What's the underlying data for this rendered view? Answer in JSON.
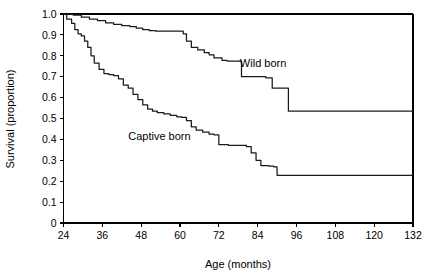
{
  "chart_data": {
    "type": "line",
    "subtype": "kaplan-meier-step",
    "title": "",
    "xlabel": "Age (months)",
    "ylabel": "Survival (proportion)",
    "xlim": [
      24,
      132
    ],
    "ylim": [
      0,
      1.0
    ],
    "xticks": [
      24,
      36,
      48,
      60,
      72,
      84,
      96,
      108,
      120,
      132
    ],
    "xtick_labels": [
      "24",
      "36",
      "48",
      "60",
      "72",
      "84",
      "96",
      "108",
      "120",
      "132"
    ],
    "yticks": [
      0,
      0.1,
      0.2,
      0.3,
      0.4,
      0.5,
      0.6,
      0.7,
      0.8,
      0.9,
      1.0
    ],
    "ytick_labels": [
      "0",
      "0.1",
      "0.2",
      "0.3",
      "0.4",
      "0.5",
      "0.6",
      "0.7",
      "0.8",
      "0.9",
      "1.0"
    ],
    "grid": false,
    "legend_position": "inline-annotation",
    "line_color": "#1a1a1a",
    "series": [
      {
        "name": "Wild born",
        "label": "Wild born",
        "label_x": 78.5,
        "label_y": 0.745,
        "x": [
          24.0,
          25.5,
          27.0,
          29.5,
          32.0,
          34.5,
          37.0,
          39.5,
          42.0,
          44.5,
          46.5,
          48.5,
          50.5,
          52.5,
          55.0,
          57.5,
          60.0,
          61.0,
          62.0,
          63.5,
          65.5,
          67.5,
          69.0,
          70.5,
          73.0,
          74.5,
          79.0,
          85.0,
          86.5,
          88.5,
          92.0,
          93.5,
          132.0
        ],
        "y": [
          1.0,
          1.0,
          0.995,
          0.985,
          0.975,
          0.968,
          0.958,
          0.95,
          0.945,
          0.94,
          0.932,
          0.925,
          0.92,
          0.918,
          0.918,
          0.918,
          0.918,
          0.905,
          0.87,
          0.84,
          0.828,
          0.815,
          0.805,
          0.79,
          0.778,
          0.775,
          0.7,
          0.7,
          0.695,
          0.645,
          0.645,
          0.535,
          0.535
        ]
      },
      {
        "name": "Captive born",
        "label": "Captive born",
        "label_x": 44.0,
        "label_y": 0.395,
        "x": [
          24.0,
          25.0,
          26.5,
          27.5,
          28.5,
          29.5,
          30.5,
          31.5,
          32.5,
          33.5,
          35.0,
          36.5,
          38.0,
          39.5,
          41.0,
          42.5,
          44.0,
          45.5,
          47.0,
          48.5,
          50.0,
          51.5,
          53.0,
          55.0,
          57.0,
          59.0,
          60.5,
          62.0,
          63.5,
          65.0,
          67.0,
          69.0,
          70.5,
          72.0,
          75.0,
          79.0,
          80.5,
          82.0,
          83.5,
          85.0,
          87.5,
          89.0,
          90.0,
          132.0
        ],
        "y": [
          1.0,
          0.975,
          0.955,
          0.925,
          0.905,
          0.895,
          0.87,
          0.84,
          0.8,
          0.765,
          0.735,
          0.715,
          0.71,
          0.705,
          0.69,
          0.66,
          0.645,
          0.615,
          0.59,
          0.565,
          0.545,
          0.535,
          0.528,
          0.522,
          0.515,
          0.508,
          0.505,
          0.49,
          0.46,
          0.445,
          0.435,
          0.425,
          0.422,
          0.375,
          0.372,
          0.372,
          0.365,
          0.335,
          0.3,
          0.275,
          0.272,
          0.268,
          0.228,
          0.228
        ]
      }
    ]
  },
  "figure": {
    "background_color": "#ffffff",
    "axis_color": "#000000"
  }
}
